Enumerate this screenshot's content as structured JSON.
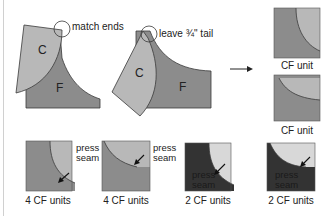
{
  "colors": {
    "light_gray": "#b8b8b8",
    "mid_gray": "#8c8c8c",
    "dark": "#333333",
    "lightest": "#d8d8d8",
    "stroke": "#3a3a3a"
  },
  "top": {
    "step1": {
      "label_c": "C",
      "label_f": "F",
      "callout": "match ends"
    },
    "step2": {
      "label_c": "C",
      "label_f": "F",
      "callout": "leave ¾\" tail"
    },
    "arrow_icon": "right-arrow-icon",
    "results": [
      {
        "caption": "CF unit"
      },
      {
        "caption": "CF unit"
      }
    ]
  },
  "bottom": {
    "units": [
      {
        "caption": "4 CF units",
        "note": "press seam",
        "style": "medium"
      },
      {
        "caption": "4 CF units",
        "note": "press seam",
        "style": "medium"
      },
      {
        "caption": "2 CF units",
        "note": "press seam",
        "style": "dark"
      },
      {
        "caption": "2 CF units",
        "note": "press seam",
        "style": "dark"
      }
    ]
  }
}
